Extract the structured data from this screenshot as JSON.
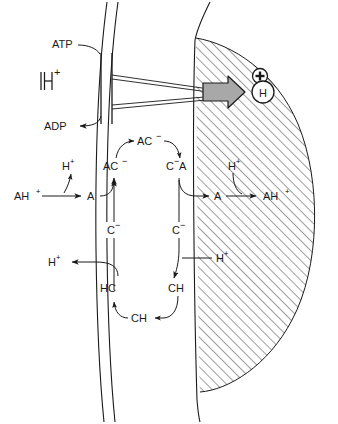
{
  "diagram": {
    "colors": {
      "stroke": "#1a1a1a",
      "arrow_fill": "#a8a8a8",
      "hatch": "#4a4a4a",
      "background": "#ffffff"
    },
    "pump": {
      "substrate_label": "ATP",
      "product_label": "ADP",
      "proton_label": "H",
      "proton_charge": "+"
    },
    "interior": {
      "charge_symbol": "+",
      "proton_circle_label": "H"
    },
    "upper_cycle": {
      "left_substrate": "AH",
      "left_substrate_charge": "+",
      "left_product": "A",
      "left_released_proton": "H",
      "left_released_proton_charge": "+",
      "carrier_left": "AC",
      "carrier_left_charge": "−",
      "carrier_top": "AC",
      "carrier_top_charge": "−",
      "carrier_right": "C",
      "carrier_right_charge": "−",
      "carrier_right_suffix": "A",
      "right_product": "A",
      "right_taken_proton": "H",
      "right_taken_proton_charge": "+",
      "right_substrate": "AH",
      "right_substrate_charge": "+"
    },
    "lower_cycle": {
      "carrier_left": "C",
      "carrier_left_charge": "−",
      "carrier_right": "C",
      "carrier_right_charge": "−",
      "protonated_left": "HC",
      "protonated_right": "CH",
      "protonated_bottom": "CH",
      "released_proton": "H",
      "released_proton_charge": "+",
      "taken_proton": "H",
      "taken_proton_charge": "+"
    }
  }
}
